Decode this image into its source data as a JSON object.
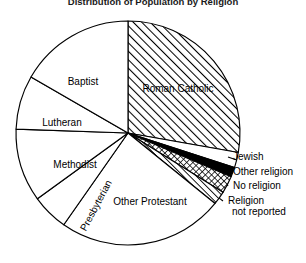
{
  "chart_data": {
    "type": "pie",
    "title": "Distribution of Population by Religion",
    "title_cropped": true,
    "xlabel": "",
    "ylabel": "",
    "legend_position": "labels-on-slices-and-callouts",
    "grid": false,
    "categories": [
      "Roman Catholic",
      "Jewish",
      "Other religion",
      "No religion",
      "Religion not reported",
      "Other Protestant",
      "Presbyterian",
      "Methodist",
      "Lutheran",
      "Baptist"
    ],
    "values": [
      27.8,
      2.2,
      1.4,
      2.5,
      1.9,
      23.9,
      5.3,
      11.1,
      7.8,
      16.1
    ],
    "slices": [
      {
        "label": "Roman Catholic",
        "value": 27.8,
        "start_angle": 0,
        "end_angle": 100,
        "fill": "diagonal-hatch",
        "label_placement": "inside",
        "label_x": 178,
        "label_y": 92
      },
      {
        "label": "Jewish",
        "value": 2.2,
        "start_angle": 100,
        "end_angle": 108,
        "fill": "white",
        "label_placement": "callout",
        "label_x": 233,
        "label_y": 160
      },
      {
        "label": "Other religion",
        "value": 1.4,
        "start_angle": 108,
        "end_angle": 113,
        "fill": "solid-black",
        "label_placement": "callout",
        "label_x": 233,
        "label_y": 175
      },
      {
        "label": "No religion",
        "value": 2.5,
        "start_angle": 113,
        "end_angle": 122,
        "fill": "cross-hatch",
        "label_placement": "callout",
        "label_x": 233,
        "label_y": 189
      },
      {
        "label": "Religion",
        "label_line2": "not reported",
        "value": 1.9,
        "start_angle": 122,
        "end_angle": 129,
        "fill": "diagonal-hatch-fine",
        "label_placement": "callout",
        "label_x": 228,
        "label_y": 204
      },
      {
        "label": "Other Protestant",
        "value": 23.9,
        "start_angle": 129,
        "end_angle": 215,
        "fill": "white",
        "label_placement": "inside",
        "label_x": 150,
        "label_y": 205
      },
      {
        "label": "Presbyterian",
        "value": 5.3,
        "start_angle": 215,
        "end_angle": 234,
        "fill": "white",
        "label_placement": "inside-rotated",
        "label_x": 99,
        "label_y": 207,
        "label_rotation": -62
      },
      {
        "label": "Methodist",
        "value": 11.1,
        "start_angle": 234,
        "end_angle": 272,
        "fill": "white",
        "label_placement": "inside",
        "label_x": 75,
        "label_y": 168
      },
      {
        "label": "Lutheran",
        "value": 7.8,
        "start_angle": 272,
        "end_angle": 300,
        "fill": "white",
        "label_placement": "inside",
        "label_x": 62,
        "label_y": 126
      },
      {
        "label": "Baptist",
        "value": 16.1,
        "start_angle": 300,
        "end_angle": 360,
        "fill": "white",
        "label_placement": "inside",
        "label_x": 83,
        "label_y": 85
      }
    ],
    "geometry": {
      "center_x": 128,
      "center_y": 133,
      "radius": 112
    },
    "colors": {
      "stroke": "#000000",
      "background": "#ffffff",
      "hatch": "#000000",
      "solid_slice": "#000000"
    }
  }
}
